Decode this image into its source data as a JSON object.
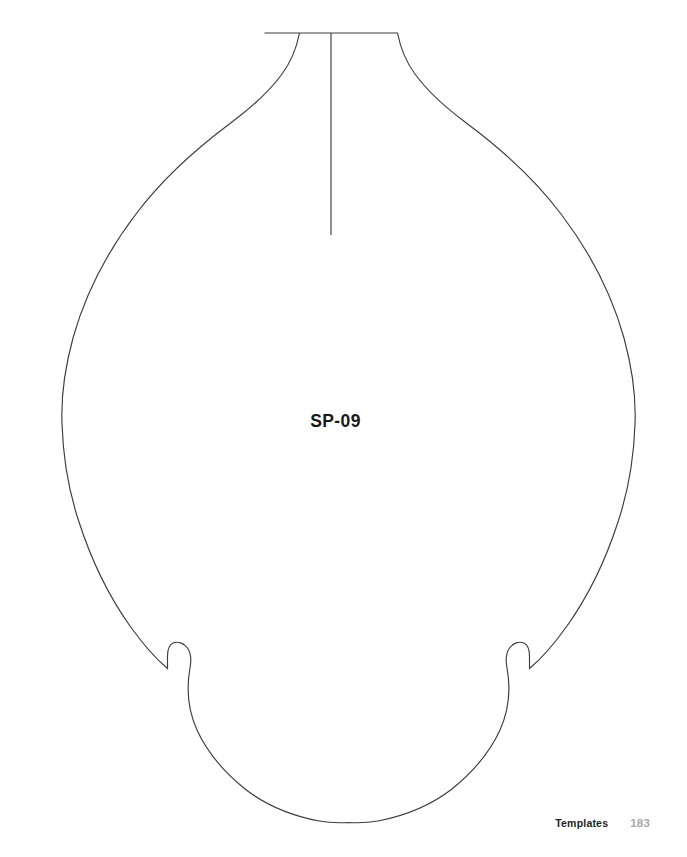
{
  "page": {
    "background_color": "#ffffff",
    "width": 687,
    "height": 857
  },
  "template": {
    "label": "SP-09",
    "label_color": "#1a1a1a",
    "outline_color": "#3c3c3c",
    "fill_color": "#ffffff",
    "shape_name": "ornament-teardrop-pattern-outline",
    "center_line": {
      "name": "center-fold-line",
      "x": 331,
      "y_start": 33,
      "y_end": 235
    },
    "outline_path": "M 264 33 L 398 33 C 414 63 432 83 455 101 C 503 139 550 188 578 245 C 611 312 636 363 635 407 C 634 457 618 516 590 571 C 566 618 546 645 529 668 L 529 655 C 516 694 497 726 468 758 C 431 797 389 807 349 822 C 310 806 268 797 231 758 C 201 725 182 693 169 655 L 169 668 C 152 645 131 618 107 571 C 79 516 63 457 62 407 C 61 363 86 312 119 245 C 147 188 194 139 242 101 C 265 83 281 63 264 33 Z"
  },
  "footer": {
    "section_label": "Templates",
    "page_number": "183",
    "label_color": "#231f20",
    "page_number_color": "#a7a9ac"
  }
}
